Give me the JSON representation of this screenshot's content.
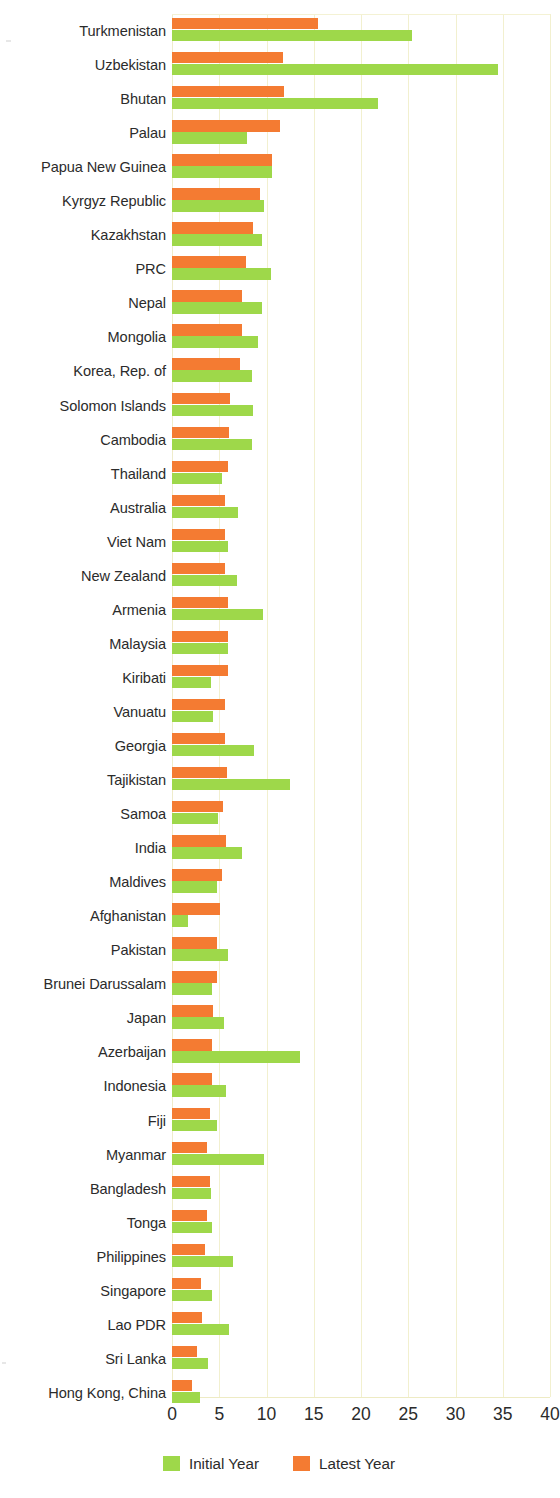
{
  "chart_data": {
    "type": "bar",
    "orientation": "horizontal",
    "title": "",
    "xlabel": "",
    "ylabel": "",
    "xlim": [
      0,
      40
    ],
    "xticks": [
      0,
      5,
      10,
      15,
      20,
      25,
      30,
      35,
      40
    ],
    "grid": true,
    "legend_position": "bottom",
    "colors": {
      "initial_year": "#9ed84a",
      "latest_year": "#f47b32"
    },
    "categories": [
      "Turkmenistan",
      "Uzbekistan",
      "Bhutan",
      "Palau",
      "Papua New Guinea",
      "Kyrgyz Republic",
      "Kazakhstan",
      "PRC",
      "Nepal",
      "Mongolia",
      "Korea, Rep. of",
      "Solomon Islands",
      "Cambodia",
      "Thailand",
      "Australia",
      "Viet Nam",
      "New Zealand",
      "Armenia",
      "Malaysia",
      "Kiribati",
      "Vanuatu",
      "Georgia",
      "Tajikistan",
      "Samoa",
      "India",
      "Maldives",
      "Afghanistan",
      "Pakistan",
      "Brunei Darussalam",
      "Japan",
      "Azerbaijan",
      "Indonesia",
      "Fiji",
      "Myanmar",
      "Bangladesh",
      "Tonga",
      "Philippines",
      "Singapore",
      "Lao PDR",
      "Sri Lanka",
      "Hong Kong, China"
    ],
    "series": [
      {
        "name": "Initial Year",
        "color": "#9ed84a",
        "values": [
          25.4,
          34.5,
          21.8,
          7.9,
          10.6,
          9.7,
          9.5,
          10.5,
          9.5,
          9.1,
          8.5,
          8.6,
          8.5,
          5.3,
          7.0,
          5.9,
          6.9,
          9.6,
          5.9,
          4.1,
          4.3,
          8.7,
          12.5,
          4.9,
          7.4,
          4.8,
          1.7,
          5.9,
          4.2,
          5.5,
          13.5,
          5.7,
          4.8,
          9.7,
          4.1,
          4.2,
          6.5,
          4.2,
          6.0,
          3.8,
          3.0
        ]
      },
      {
        "name": "Latest Year",
        "color": "#f47b32",
        "values": [
          15.5,
          11.7,
          11.9,
          11.4,
          10.6,
          9.3,
          8.6,
          7.8,
          7.4,
          7.4,
          7.2,
          6.1,
          6.0,
          5.9,
          5.6,
          5.6,
          5.6,
          5.9,
          5.9,
          5.9,
          5.6,
          5.6,
          5.8,
          5.4,
          5.7,
          5.3,
          5.1,
          4.8,
          4.8,
          4.3,
          4.2,
          4.2,
          4.0,
          3.7,
          4.0,
          3.7,
          3.5,
          3.1,
          3.2,
          2.6,
          2.1
        ]
      }
    ]
  },
  "legend": {
    "items": [
      {
        "label": "Initial Year",
        "color": "#9ed84a"
      },
      {
        "label": "Latest Year",
        "color": "#f47b32"
      }
    ]
  }
}
